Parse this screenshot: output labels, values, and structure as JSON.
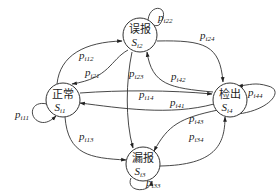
{
  "diagram": {
    "type": "state-transition",
    "nodes": [
      {
        "id": "s1",
        "label": "正常",
        "symbol": "S",
        "subscript": "i1"
      },
      {
        "id": "s2",
        "label": "误报",
        "symbol": "S",
        "subscript": "i2"
      },
      {
        "id": "s3",
        "label": "漏报",
        "symbol": "S",
        "subscript": "i3"
      },
      {
        "id": "s4",
        "label": "检出",
        "symbol": "S",
        "subscript": "i4"
      }
    ],
    "edges": [
      {
        "from": "s1",
        "to": "s1",
        "symbol": "p",
        "subscript": "i11"
      },
      {
        "from": "s1",
        "to": "s2",
        "symbol": "p",
        "subscript": "i12"
      },
      {
        "from": "s2",
        "to": "s1",
        "symbol": "p",
        "subscript": "i21"
      },
      {
        "from": "s2",
        "to": "s2",
        "symbol": "p",
        "subscript": "i22"
      },
      {
        "from": "s2",
        "to": "s3",
        "symbol": "p",
        "subscript": "i23"
      },
      {
        "from": "s2",
        "to": "s4",
        "symbol": "p",
        "subscript": "i24"
      },
      {
        "from": "s1",
        "to": "s3",
        "symbol": "p",
        "subscript": "i13"
      },
      {
        "from": "s1",
        "to": "s4",
        "symbol": "p",
        "subscript": "i14"
      },
      {
        "from": "s4",
        "to": "s1",
        "symbol": "p",
        "subscript": "i41"
      },
      {
        "from": "s4",
        "to": "s2",
        "symbol": "p",
        "subscript": "i42"
      },
      {
        "from": "s4",
        "to": "s3",
        "symbol": "p",
        "subscript": "i43"
      },
      {
        "from": "s3",
        "to": "s4",
        "symbol": "p",
        "subscript": "i34"
      },
      {
        "from": "s3",
        "to": "s3",
        "symbol": "p",
        "subscript": "i33"
      },
      {
        "from": "s4",
        "to": "s4",
        "symbol": "p",
        "subscript": "i44"
      }
    ]
  }
}
